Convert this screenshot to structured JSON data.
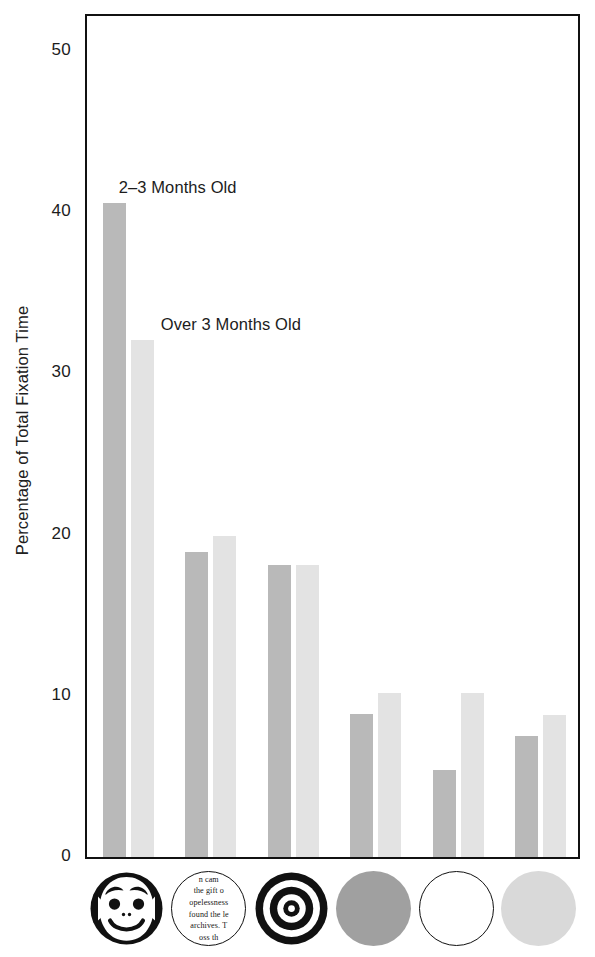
{
  "chart_data": {
    "type": "bar",
    "title": "",
    "xlabel": "",
    "ylabel": "Percentage of Total Fixation Time",
    "ylim": [
      0,
      52.5
    ],
    "yticks": [
      0,
      10,
      20,
      30,
      40,
      50
    ],
    "ytick_labels": [
      "0",
      "10",
      "20",
      "30",
      "40",
      "50"
    ],
    "grid": false,
    "legend_position": "in-plot annotations",
    "categories": [
      "schematic-face",
      "newsprint",
      "bullseye",
      "solid-gray-disc",
      "plain-white-disc",
      "light-gray-disc"
    ],
    "series": [
      {
        "name": "2-3 Months Old",
        "color": "#b9b9b9",
        "values": [
          40.6,
          18.9,
          18.1,
          8.9,
          5.4,
          7.5
        ]
      },
      {
        "name": "Over 3 Months Old",
        "color": "#e3e3e3",
        "values": [
          32.1,
          19.9,
          18.1,
          10.2,
          10.2,
          8.8
        ]
      }
    ],
    "annotations": [
      {
        "text": "2-3 Months Old",
        "near_bar": "schematic-face / 2-3 Months Old"
      },
      {
        "text": "Over 3 Months Old",
        "near_bar": "schematic-face / Over 3 Months Old"
      }
    ]
  },
  "axis": {
    "y_title": "Percentage of Total Fixation Time",
    "ticks": [
      {
        "value": 50,
        "label": "50"
      },
      {
        "value": 40,
        "label": "40"
      },
      {
        "value": 30,
        "label": "30"
      },
      {
        "value": 20,
        "label": "20"
      },
      {
        "value": 10,
        "label": "10"
      },
      {
        "value": 0,
        "label": "0"
      }
    ]
  },
  "annotations": {
    "series_a": "2–3 Months Old",
    "series_b": "Over 3 Months Old"
  },
  "stimuli": [
    {
      "id": "schematic-face",
      "name": "schematic-face-icon",
      "caption": ""
    },
    {
      "id": "newsprint",
      "name": "newsprint-disc-icon",
      "caption": "",
      "lines": [
        "n cam",
        "the gift o",
        "opelessness",
        "found the le",
        "archives.  T",
        "oss th"
      ]
    },
    {
      "id": "bullseye",
      "name": "bullseye-icon",
      "caption": ""
    },
    {
      "id": "solid-gray-disc",
      "name": "solid-gray-disc-icon",
      "caption": "",
      "color": "#a0a0a0"
    },
    {
      "id": "plain-white-disc",
      "name": "plain-white-disc-icon",
      "caption": "",
      "color": "#ffffff"
    },
    {
      "id": "light-gray-disc",
      "name": "light-gray-disc-icon",
      "caption": "",
      "color": "#d9d9d9"
    }
  ]
}
